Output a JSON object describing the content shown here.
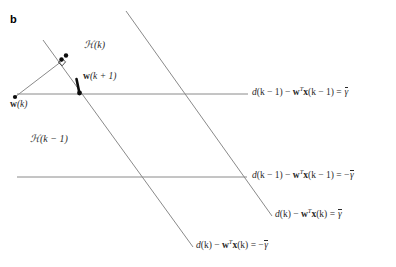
{
  "figure": {
    "panel_letter": "b",
    "background_color": "#ffffff",
    "line_color": "#808080",
    "point_color": "#000000",
    "width": 396,
    "height": 267
  },
  "region_labels": {
    "hk": "ℋ(k)",
    "hk_minus_1": "ℋ(k − 1)"
  },
  "points": [
    {
      "name": "w(k)",
      "label_prefix": "w",
      "label_arg": "(k)",
      "x": 15,
      "y": 97
    },
    {
      "name": "w(k+1)",
      "label_prefix": "w",
      "label_arg": "(k + 1)",
      "x": 75,
      "y": 92
    },
    {
      "name": "projection-foot",
      "label_prefix": "",
      "label_arg": "",
      "x": 61,
      "y": 59
    },
    {
      "name": "intermediate",
      "label_prefix": "",
      "label_arg": "",
      "x": 66,
      "y": 56
    }
  ],
  "constraint_lines": [
    {
      "id": "d-km1-upper",
      "orientation": "horizontal",
      "value_sign": "+",
      "label": "d(k − 1) − wᵀx(k − 1) = γ̄",
      "label_parts": {
        "d": "d",
        "arg1": "(k − 1) − ",
        "w": "w",
        "sup": "T",
        "x": "x",
        "arg2": "(k − 1) = ",
        "rhs": "γ̄"
      },
      "x1": 17,
      "y1": 94,
      "x2": 248,
      "y2": 94
    },
    {
      "id": "d-km1-lower",
      "orientation": "horizontal",
      "value_sign": "−",
      "label": "d(k − 1) − wᵀx(k − 1) = −γ̄",
      "label_parts": {
        "d": "d",
        "arg1": "(k − 1) − ",
        "w": "w",
        "sup": "T",
        "x": "x",
        "arg2": "(k − 1) = −",
        "rhs": "γ̄"
      },
      "x1": 17,
      "y1": 177,
      "x2": 247,
      "y2": 177
    },
    {
      "id": "d-k-upper",
      "orientation": "diagonal",
      "value_sign": "+",
      "label": "d(k) − wᵀx(k) = γ̄",
      "label_parts": {
        "d": "d",
        "arg1": "(k) − ",
        "w": "w",
        "sup": "T",
        "x": "x",
        "arg2": "(k) = ",
        "rhs": "γ̄"
      },
      "x1": 126,
      "y1": 11,
      "x2": 272,
      "y2": 216
    },
    {
      "id": "d-k-lower",
      "orientation": "diagonal",
      "value_sign": "−",
      "label": "d(k) − wᵀx(k) = −γ̄",
      "label_parts": {
        "d": "d",
        "arg1": "(k) − ",
        "w": "w",
        "sup": "T",
        "x": "x",
        "arg2": "(k) = −",
        "rhs": "γ̄"
      },
      "x1": 43,
      "y1": 40,
      "x2": 193,
      "y2": 247
    }
  ],
  "update_path": {
    "from": "w(k)",
    "via": "projection-foot",
    "to": "w(k+1)",
    "right_angle_marker": true
  }
}
